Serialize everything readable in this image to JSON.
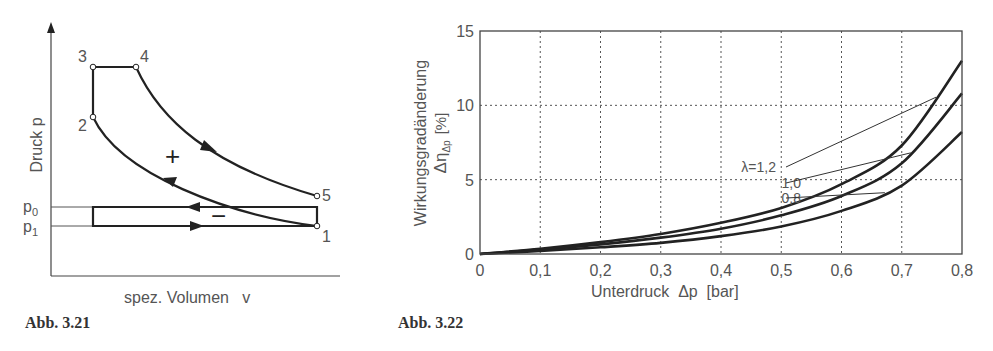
{
  "figures": [
    {
      "caption": "Abb. 3.21",
      "ylabel": "Druck  p",
      "xlabel": "spez. Volumen   v",
      "points": [
        "1",
        "2",
        "3",
        "4",
        "5"
      ],
      "pressure_labels": {
        "p0": "p",
        "p0_sub": "0",
        "p1": "p",
        "p1_sub": "1"
      },
      "area_signs": {
        "positive": "+",
        "negative": "−"
      }
    },
    {
      "caption": "Abb. 3.22"
    }
  ],
  "chart_data": [
    {
      "type": "diagram",
      "title": "p-v diagram (Seiliger cycle with gas exchange loop)",
      "xlabel": "spez. Volumen v",
      "ylabel": "Druck p",
      "points": [
        "1",
        "2",
        "3",
        "4",
        "5"
      ],
      "levels": [
        "p0",
        "p1"
      ]
    },
    {
      "type": "line",
      "title": "",
      "xlabel": "Unterdruck  Δp  [bar]",
      "ylabel_line1": "Wirkungsgradänderung",
      "ylabel_line2": "Δη",
      "ylabel_sub": "Δp",
      "ylabel_unit": "[%]",
      "xlim": [
        0,
        0.8
      ],
      "ylim": [
        0,
        15
      ],
      "grid": true,
      "x_ticks": [
        "0",
        "0,1",
        "0,2",
        "0,3",
        "0,4",
        "0,5",
        "0,6",
        "0,7",
        "0,8"
      ],
      "y_ticks": [
        "0",
        "5",
        "10",
        "15"
      ],
      "x": [
        0,
        0.1,
        0.2,
        0.3,
        0.4,
        0.5,
        0.6,
        0.7,
        0.8
      ],
      "series": [
        {
          "name": "λ=1,2",
          "label": "λ=1,2",
          "values": [
            0,
            0.35,
            0.8,
            1.35,
            2.1,
            3.1,
            4.7,
            7.3,
            13.0
          ]
        },
        {
          "name": "1,0",
          "label": "1,0",
          "values": [
            0,
            0.3,
            0.65,
            1.1,
            1.7,
            2.6,
            3.9,
            6.1,
            10.8
          ]
        },
        {
          "name": "0,8",
          "label": "0,8",
          "values": [
            0,
            0.2,
            0.45,
            0.75,
            1.2,
            1.85,
            2.9,
            4.6,
            8.2
          ]
        }
      ],
      "legend": "inline annotation, right of center"
    }
  ]
}
